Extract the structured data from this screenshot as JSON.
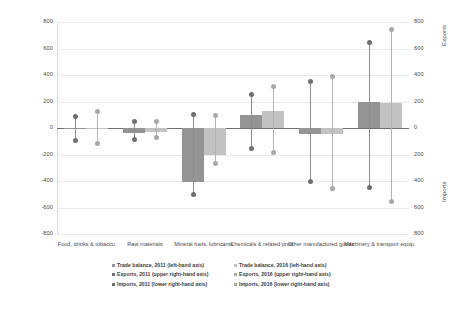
{
  "chart_data": {
    "type": "bar",
    "title": "",
    "xlabel": "",
    "ylabel": "Trade balance",
    "ylabel_right_upper": "Exports",
    "ylabel_right_lower": "Imports",
    "ylim": [
      -800,
      800
    ],
    "grid": true,
    "legend_position": "bottom",
    "categories": [
      "Food, drinks & tobacco",
      "Raw materials",
      "Mineral fuels, lubricants",
      "Chemicals & related prod.",
      "Other manufactured goods",
      "Machinery & transport equip."
    ],
    "yticks_left": [
      800,
      600,
      400,
      200,
      0,
      -200,
      -400,
      -600,
      -800
    ],
    "yticks_right": [
      800,
      600,
      400,
      200,
      0,
      200,
      400,
      600,
      800
    ],
    "series": [
      {
        "name": "Trade balance, 2011 (left-hand axis)",
        "values": [
          -2,
          -35,
          -410,
          95,
          -48,
          198
        ]
      },
      {
        "name": "Exports, 2011 (upper right-hand axis)",
        "values": [
          90,
          48,
          105,
          250,
          350,
          645
        ]
      },
      {
        "name": "Imports, 2011 (lower right-hand axis)",
        "values": [
          -92,
          -88,
          -500,
          -158,
          -405,
          -450
        ]
      },
      {
        "name": "Trade balance, 2016 (left-hand axis)",
        "values": [
          2,
          -28,
          -200,
          128,
          -42,
          192
        ]
      },
      {
        "name": "Exports, 2016 (upper right-hand axis)",
        "values": [
          122,
          48,
          98,
          315,
          392,
          742
        ]
      },
      {
        "name": "Imports, 2016 (lower right-hand axis)",
        "values": [
          -118,
          -72,
          -268,
          -188,
          -455,
          -552
        ]
      }
    ],
    "colors": {
      "balance_2011": "#949494",
      "balance_2016": "#c2c2c2",
      "marker_2011": "#6e6e6e",
      "marker_2016": "#a8a8a8",
      "gridline": "#e9e9e9",
      "zeroline": "#6f6f6f",
      "background": "#ffffff"
    }
  },
  "legend": {
    "left_column": [
      "Trade balance, 2011 (left-hand axis)",
      "Exports, 2011 (upper right-hand axis)",
      "Imports, 2011 (lower right-hand axis)"
    ],
    "right_column": [
      "Trade balance, 2016 (left-hand axis)",
      "Exports, 2016 (upper right-hand axis)",
      "Imports, 2016 (lower right-hand axis)"
    ]
  }
}
